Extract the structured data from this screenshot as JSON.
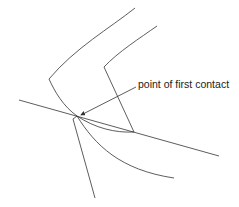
{
  "diagram": {
    "annotation": "point of first contact",
    "colors": {
      "line": "#333333",
      "text": "#222222",
      "background": "#ffffff"
    },
    "elements": [
      "upper-wedge-outer-curve",
      "upper-wedge-inner-edge",
      "tangent-line",
      "lower-wedge-straight-edge",
      "lower-wedge-curved-edge",
      "contact-lens-curve",
      "annotation-arrow"
    ]
  }
}
